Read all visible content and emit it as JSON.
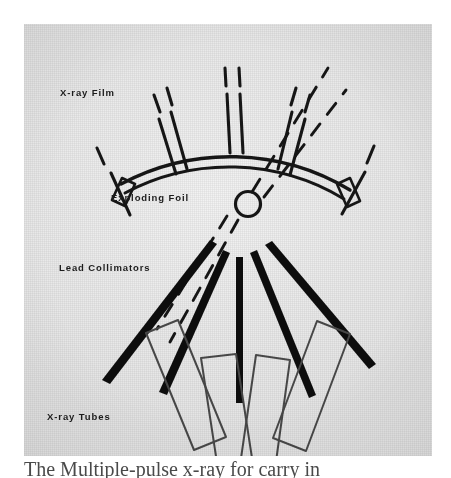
{
  "figure": {
    "kind": "scanned-schematic-photograph",
    "caption_partial": "The Multiple-pulse x-ray for carry in",
    "background_color": "#e9e9e9",
    "ink_color": "#101010",
    "outline_color": "#3a3a3a"
  },
  "labels": {
    "film": "X-ray Film",
    "foil": "Exploding Foil",
    "collimators": "Lead Collimators",
    "tubes": "X-ray Tubes"
  },
  "components": {
    "film_arc": {
      "name": "x-ray-film-arc",
      "description": "double-line arc of film with paired radial tick marks and rectangular end caps",
      "center": [
        206,
        292
      ],
      "radius_inner": 228,
      "radius_outer": 238,
      "start_angle_deg": 208,
      "end_angle_deg": 332,
      "tick_pair_angles_deg": [
        212,
        235,
        237,
        264,
        266,
        293,
        295,
        318,
        328
      ],
      "end_cap_count": 2
    },
    "exploding_foil": {
      "name": "exploding-foil",
      "description": "small circle at the convergence point of all rays",
      "center": [
        224,
        180
      ],
      "radius": 12
    },
    "lead_collimators": {
      "name": "lead-collimators",
      "description": "five thick black wedge bars radiating downward from near the foil",
      "count": 5
    },
    "x_ray_tubes": {
      "name": "x-ray-tubes",
      "description": "four thin outlined rectangles arranged in a fan at the bottom",
      "count": 4
    },
    "ray_paths": {
      "name": "dashed-ray-paths",
      "description": "dashed lines tracing the x-ray beam from the leftmost tube through the foil to the film arc",
      "upper_count": 2,
      "lower_count": 2
    }
  }
}
